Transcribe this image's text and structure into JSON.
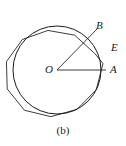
{
  "figure": {
    "caption": "(b)",
    "labels": {
      "center": "O",
      "tangent_point": "A",
      "vertex": "B",
      "midpoint": "E"
    },
    "colors": {
      "stroke": "#1a1a1a",
      "background": "#ffffff"
    },
    "geometry": {
      "circle": {
        "cx": 57,
        "cy": 70,
        "r": 44
      },
      "polygon_sides": 10,
      "polygon_circumradius": 46.5,
      "polygon_rotation_deg": 8,
      "radius_OA": {
        "x1": 57,
        "y1": 70,
        "x2": 106,
        "y2": 70
      },
      "radius_OB": {
        "x1": 57,
        "y1": 70,
        "x2": 97,
        "y2": 29
      }
    }
  }
}
